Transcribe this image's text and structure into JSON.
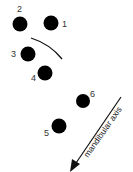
{
  "diagram": {
    "points": [
      {
        "id": "1",
        "label": "1",
        "cx": 51,
        "cy": 23,
        "lx": 62,
        "ly": 27
      },
      {
        "id": "2",
        "label": "2",
        "cx": 20,
        "cy": 24,
        "lx": 17,
        "ly": 12
      },
      {
        "id": "3",
        "label": "3",
        "cx": 28,
        "cy": 54,
        "lx": 11,
        "ly": 57
      },
      {
        "id": "4",
        "label": "4",
        "cx": 45,
        "cy": 73,
        "lx": 31,
        "ly": 81
      },
      {
        "id": "5",
        "label": "5",
        "cx": 59,
        "cy": 126,
        "lx": 44,
        "ly": 136
      },
      {
        "id": "6",
        "label": "6",
        "cx": 83,
        "cy": 101,
        "lx": 90,
        "ly": 97
      }
    ],
    "axis_label": "mandibular axis",
    "colors": {
      "dot": "#000000",
      "line": "#111111"
    }
  }
}
